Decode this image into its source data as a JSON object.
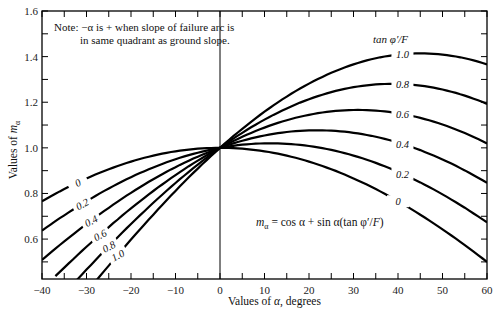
{
  "chart_data": {
    "type": "line",
    "title": "",
    "xlabel": "Values of α, degrees",
    "ylabel": "Values of m_α",
    "xlim": [
      -40,
      60
    ],
    "ylim": [
      0.425,
      1.6
    ],
    "grid": false,
    "x_ticks": [
      -40,
      -30,
      -20,
      -10,
      0,
      10,
      20,
      30,
      40,
      50,
      60
    ],
    "y_ticks": [
      0.6,
      0.8,
      1.0,
      1.2,
      1.4,
      1.6
    ],
    "x_minor_step": 5,
    "y_minor_step": 0.1,
    "legend_title": "tan φ′/F",
    "legend_position": "curve-end labels (right) and curve labels (left)",
    "formula": "m_α = cos α + sin α(tan φ′/F)",
    "note": [
      "Note: −α is + when slope of failure arc is",
      "in same quadrant as ground slope."
    ],
    "vertical_reference_line_at_x": 0,
    "series": [
      {
        "name": "0",
        "tan_phi_over_F": 0.0,
        "alpha_start": -40,
        "alpha_end": 60,
        "x": [
          -40,
          -30,
          -20,
          -10,
          0,
          10,
          20,
          30,
          40,
          50,
          60
        ],
        "values": [
          0.766,
          0.866,
          0.94,
          0.985,
          1.0,
          0.985,
          0.94,
          0.866,
          0.766,
          0.643,
          0.5
        ]
      },
      {
        "name": "0.2",
        "tan_phi_over_F": 0.2,
        "alpha_start": -40,
        "alpha_end": 60,
        "x": [
          -40,
          -30,
          -20,
          -10,
          0,
          10,
          20,
          30,
          40,
          50,
          60
        ],
        "values": [
          0.637,
          0.766,
          0.871,
          0.95,
          1.0,
          1.02,
          1.008,
          0.966,
          0.895,
          0.796,
          0.673
        ]
      },
      {
        "name": "0.4",
        "tan_phi_over_F": 0.4,
        "alpha_start": -40,
        "alpha_end": 60,
        "x": [
          -40,
          -30,
          -20,
          -10,
          0,
          10,
          20,
          30,
          40,
          50,
          60
        ],
        "values": [
          0.509,
          0.666,
          0.803,
          0.915,
          1.0,
          1.054,
          1.077,
          1.066,
          1.023,
          0.949,
          0.846
        ]
      },
      {
        "name": "0.6",
        "tan_phi_over_F": 0.6,
        "alpha_start": -37,
        "alpha_end": 60,
        "x": [
          -35,
          -30,
          -20,
          -10,
          0,
          10,
          20,
          30,
          40,
          50,
          60
        ],
        "values": [
          0.475,
          0.566,
          0.735,
          0.881,
          1.0,
          1.089,
          1.145,
          1.166,
          1.152,
          1.103,
          1.02
        ]
      },
      {
        "name": "0.8",
        "tan_phi_over_F": 0.8,
        "alpha_start": -35,
        "alpha_end": 60,
        "x": [
          -35,
          -30,
          -20,
          -10,
          0,
          10,
          20,
          30,
          40,
          50,
          60
        ],
        "values": [
          0.46,
          0.466,
          0.666,
          0.846,
          1.0,
          1.124,
          1.213,
          1.266,
          1.28,
          1.256,
          1.193
        ]
      },
      {
        "name": "1.0",
        "tan_phi_over_F": 1.0,
        "alpha_start": -30,
        "alpha_end": 60,
        "x": [
          -30,
          -20,
          -10,
          0,
          10,
          20,
          30,
          40,
          50,
          60
        ],
        "values": [
          0.47,
          0.598,
          0.811,
          1.0,
          1.158,
          1.282,
          1.366,
          1.409,
          1.409,
          1.366
        ]
      }
    ]
  },
  "labels": {
    "note_line1": "Note: −α is + when slope of failure arc is",
    "note_line2": "in same quadrant as ground slope.",
    "legend_title": "tan φ′/F",
    "formula": "mα = cos α + sin α(tan φ′/F)",
    "xlabel": "Values of α, degrees",
    "ylabel": "Values of mα",
    "x_tick_labels": [
      "−40",
      "−30",
      "−20",
      "−10",
      "0",
      "10",
      "20",
      "30",
      "40",
      "50",
      "60"
    ],
    "y_tick_labels": [
      "0.6",
      "0.8",
      "1.0",
      "1.2",
      "1.4",
      "1.6"
    ],
    "right_curve_labels": [
      "1.0",
      "0.8",
      "0.6",
      "0.4",
      "0.2",
      "0"
    ],
    "left_curve_labels": [
      "0",
      "0.2",
      "0.4",
      "0.6",
      "0.8",
      "1.0"
    ]
  }
}
